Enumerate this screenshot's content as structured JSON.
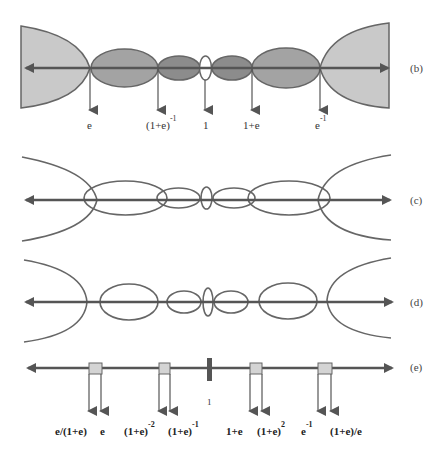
{
  "figure": {
    "panels": [
      {
        "id": "b",
        "tag": "(b)",
        "axis_y": 68,
        "style": "filled regions",
        "labels": [
          {
            "base": "e",
            "sup": "",
            "x": 90
          },
          {
            "base": "(1+e)",
            "sup": "-1",
            "x": 158
          },
          {
            "base": "1",
            "sup": "",
            "x": 205
          },
          {
            "base": "1+e",
            "sup": "",
            "x": 252
          },
          {
            "base": "e",
            "sup": "-1",
            "x": 320
          }
        ]
      },
      {
        "id": "c",
        "tag": "(c)",
        "axis_y": 200,
        "style": "overlapping outlines"
      },
      {
        "id": "d",
        "tag": "(d)",
        "axis_y": 302,
        "style": "disjoint outlines"
      },
      {
        "id": "e",
        "tag": "(e)",
        "axis_y": 368,
        "style": "interval boxes",
        "center_label": "1",
        "labels": [
          {
            "base": "e/(1+e)",
            "sup": ""
          },
          {
            "base": "e",
            "sup": ""
          },
          {
            "base": "(1+e)",
            "sup": "-2"
          },
          {
            "base": "(1+e)",
            "sup": "-1"
          },
          {
            "base": "1+e",
            "sup": ""
          },
          {
            "base": "(1+e)",
            "sup": "2"
          },
          {
            "base": "e",
            "sup": "-1"
          },
          {
            "base": "(1+e)/e",
            "sup": ""
          }
        ]
      }
    ],
    "colors": {
      "outer_fill": "#c9c9c9",
      "mid_fill": "#a3a3a3",
      "inner_fill": "#8c8c8c",
      "box_fill": "#d4d4d4",
      "stroke": "#555555"
    }
  }
}
